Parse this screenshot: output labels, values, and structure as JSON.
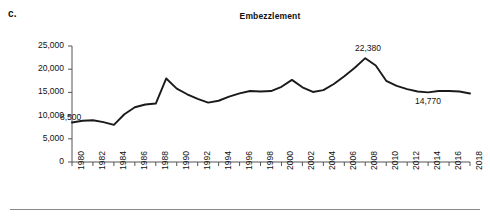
{
  "figure": {
    "panel_label": "c.",
    "title": "Embezzlement"
  },
  "axes": {
    "y_ticks": [
      "25,000",
      "20,000",
      "15,000",
      "10,000",
      "5,000",
      "0"
    ],
    "x_ticks": [
      "1980",
      "1982",
      "1984",
      "1986",
      "1988",
      "1990",
      "1992",
      "1994",
      "1996",
      "1998",
      "2000",
      "2002",
      "2004",
      "2006",
      "2008",
      "2010",
      "2012",
      "2014",
      "2016",
      "2018"
    ]
  },
  "annotations": {
    "start": "8,500",
    "peak": "22,380",
    "end": "14,770"
  },
  "style": {
    "line_color": "#1a1a1a",
    "axis_color": "#555555",
    "rule_color": "#8a8a8a"
  },
  "chart_data": {
    "type": "line",
    "title": "Embezzlement",
    "xlabel": "",
    "ylabel": "",
    "xlim": [
      1980,
      2018
    ],
    "ylim": [
      0,
      25000
    ],
    "grid": false,
    "legend": "none",
    "y_tick_values": [
      0,
      5000,
      10000,
      15000,
      20000,
      25000
    ],
    "x_tick_values": [
      1980,
      1982,
      1984,
      1986,
      1988,
      1990,
      1992,
      1994,
      1996,
      1998,
      2000,
      2002,
      2004,
      2006,
      2008,
      2010,
      2012,
      2014,
      2016,
      2018
    ],
    "x": [
      1980,
      1981,
      1982,
      1983,
      1984,
      1985,
      1986,
      1987,
      1988,
      1989,
      1990,
      1991,
      1992,
      1993,
      1994,
      1995,
      1996,
      1997,
      1998,
      1999,
      2000,
      2001,
      2002,
      2003,
      2004,
      2005,
      2006,
      2007,
      2008,
      2009,
      2010,
      2011,
      2012,
      2013,
      2014,
      2015,
      2016,
      2017,
      2018
    ],
    "values": [
      8500,
      8900,
      9000,
      8600,
      8000,
      10300,
      11800,
      12400,
      12600,
      18000,
      15800,
      14600,
      13600,
      12800,
      13200,
      14100,
      14800,
      15300,
      15200,
      15300,
      16200,
      17700,
      16100,
      15100,
      15500,
      16800,
      18500,
      20300,
      22380,
      20800,
      17500,
      16400,
      15700,
      15200,
      15000,
      15300,
      15300,
      15200,
      14770
    ],
    "data_labels": [
      {
        "x": 1980,
        "value": 8500,
        "text": "8,500"
      },
      {
        "x": 2008,
        "value": 22380,
        "text": "22,380"
      },
      {
        "x": 2018,
        "value": 14770,
        "text": "14,770"
      }
    ]
  }
}
